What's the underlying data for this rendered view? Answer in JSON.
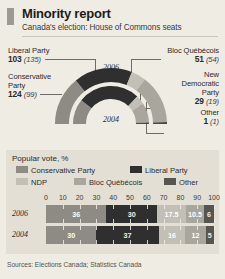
{
  "header": {
    "title": "Minority report",
    "subtitle": "Canada's election: House of Commons seats",
    "accent_color": "#9c9a94"
  },
  "seats": {
    "year_outer": "2006",
    "year_inner": "2004",
    "parties": [
      {
        "name": "Liberal Party",
        "seats_2006": "103",
        "seats_2004": "(135)",
        "color": "#2f2f2f"
      },
      {
        "name": "Conservative Party",
        "seats_2006": "124",
        "seats_2004": "(99)",
        "color": "#8e8b84"
      },
      {
        "name": "Bloc Québécois",
        "seats_2006": "51",
        "seats_2004": "(54)",
        "color": "#b5b2aa"
      },
      {
        "name": "New Democratic Party",
        "seats_2006": "29",
        "seats_2004": "(19)",
        "color": "#6e6b65"
      },
      {
        "name": "Other",
        "seats_2006": "1",
        "seats_2004": "(1)",
        "color": "#4a4843"
      }
    ],
    "labels": {
      "liberal_name": "Liberal Party",
      "liberal_val": "103",
      "liberal_prev": "(135)",
      "conservative_name_1": "Conservative",
      "conservative_name_2": "Party",
      "conservative_val": "124",
      "conservative_prev": "(99)",
      "bloc_name": "Bloc Québécois",
      "bloc_val": "51",
      "bloc_prev": "(54)",
      "ndp_name_1": "New",
      "ndp_name_2": "Democratic",
      "ndp_name_3": "Party",
      "ndp_val": "29",
      "ndp_prev": "(19)",
      "other_name": "Other",
      "other_val": "1",
      "other_prev": "(1)"
    }
  },
  "vote": {
    "title": "Popular vote, %",
    "legend": [
      {
        "label": "Conservative Party",
        "color": "#8e8b84"
      },
      {
        "label": "Liberal Party",
        "color": "#2f2f2f"
      },
      {
        "label": "NDP",
        "color": "#c2bfb7"
      },
      {
        "label": "Bloc Québécois",
        "color": "#a9a69e"
      },
      {
        "label": "Other",
        "color": "#57554f"
      }
    ]
  },
  "chart_data": {
    "type": "bar",
    "title": "Popular vote, %",
    "xlabel": "",
    "ylabel": "",
    "xlim": [
      0,
      100
    ],
    "ticks": [
      "0",
      "10",
      "20",
      "30",
      "40",
      "50",
      "60",
      "70",
      "80",
      "90",
      "100"
    ],
    "orientation": "horizontal",
    "stacked": true,
    "grid": true,
    "legend_position": "top",
    "categories": [
      "2006",
      "2004"
    ],
    "series": [
      {
        "name": "Conservative Party",
        "color": "#8e8b84",
        "values": [
          36,
          30
        ],
        "labels": [
          "36",
          "30"
        ]
      },
      {
        "name": "Liberal Party",
        "color": "#2f2f2f",
        "values": [
          30,
          37
        ],
        "labels": [
          "30",
          "37"
        ]
      },
      {
        "name": "NDP",
        "color": "#c2bfb7",
        "values": [
          17.5,
          16
        ],
        "labels": [
          "17.5",
          "16"
        ]
      },
      {
        "name": "Bloc Québécois",
        "color": "#a9a69e",
        "values": [
          10.5,
          12
        ],
        "labels": [
          "10.5",
          "12"
        ]
      },
      {
        "name": "Other",
        "color": "#57554f",
        "values": [
          6,
          5
        ],
        "labels": [
          "6",
          "5"
        ]
      }
    ],
    "seat_rings": {
      "type": "pie",
      "title": "House of Commons seats",
      "rings": [
        {
          "name": "2006",
          "total": 308,
          "labels": [
            "Liberal Party",
            "Conservative Party",
            "Bloc Québécois",
            "New Democratic Party",
            "Other"
          ],
          "values": [
            103,
            124,
            51,
            29,
            1
          ]
        },
        {
          "name": "2004",
          "total": 308,
          "labels": [
            "Liberal Party",
            "Conservative Party",
            "Bloc Québécois",
            "New Democratic Party",
            "Other"
          ],
          "values": [
            135,
            99,
            54,
            19,
            1
          ]
        }
      ]
    }
  },
  "source": "Sources: Elections Canada; Statistics Canada"
}
